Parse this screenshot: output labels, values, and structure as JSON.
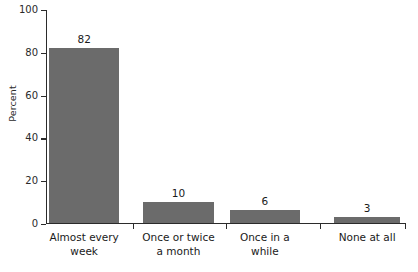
{
  "chart_data": {
    "type": "bar",
    "title": "",
    "subtitle": "",
    "xlabel": "",
    "ylabel": "Percent",
    "ylim": [
      0,
      100
    ],
    "yticks": [
      0,
      20,
      40,
      60,
      80,
      100
    ],
    "grid": false,
    "legend": null,
    "orientation": "vertical",
    "bar_color": "#6b6b6b",
    "axis_color": "#2b2b2b",
    "text_color": "#1a1a1a",
    "background": "#ffffff",
    "categories": [
      "Almost every week",
      "Once or twice a month",
      "Once in a while",
      "None at all"
    ],
    "category_lines": [
      [
        "Almost every",
        "week"
      ],
      [
        "Once or twice",
        "a month"
      ],
      [
        "Once in a",
        "while"
      ],
      [
        "None at all"
      ]
    ],
    "values": [
      82,
      10,
      6,
      3
    ],
    "value_labels": [
      "82",
      "10",
      "6",
      "3"
    ],
    "bars": [
      {
        "label": "Almost every week",
        "value": 82,
        "value_label": "82",
        "left_pct": 0.8,
        "width_pct": 19.6
      },
      {
        "label": "Once or twice a month",
        "value": 10,
        "value_label": "10",
        "left_pct": 27.0,
        "width_pct": 19.6
      },
      {
        "label": "Once in a while",
        "value": 6,
        "value_label": "6",
        "left_pct": 51.0,
        "width_pct": 19.6
      },
      {
        "label": "None at all",
        "value": 3,
        "value_label": "3",
        "left_pct": 80.0,
        "width_pct": 18.4
      }
    ],
    "xtick_positions_pct": [
      24.2,
      50.0,
      76.0,
      99.6
    ]
  },
  "axis": {
    "y_title": "Percent",
    "y_tick_labels": [
      "100",
      "80",
      "60",
      "40",
      "20",
      "0"
    ]
  }
}
